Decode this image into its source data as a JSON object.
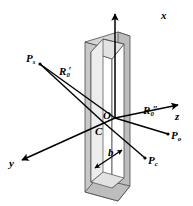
{
  "figure": {
    "kind": "3d-geometry-diagram",
    "background_color": "#ffffff",
    "line_color": "#000000",
    "frame_fill_color": "#c8c8c8",
    "frame_edge_color": "#4a4a4a",
    "frame_inner_fill_color": "#ffffff"
  },
  "axes": [
    {
      "name": "x-axis",
      "label": "x",
      "direction": "up"
    },
    {
      "name": "y-axis",
      "label": "y",
      "direction": "down-left"
    },
    {
      "name": "z-axis",
      "label": "z",
      "direction": "right"
    }
  ],
  "points": [
    {
      "name": "source-point",
      "label": "P",
      "sub": "s"
    },
    {
      "name": "observation-point",
      "label": "P",
      "sub": "o"
    },
    {
      "name": "center-observation-point",
      "label": "P",
      "sub": "c"
    },
    {
      "name": "origin-point",
      "label": "O",
      "sub": ""
    },
    {
      "name": "aperture-center-point",
      "label": "C",
      "sub": ""
    }
  ],
  "distances": [
    {
      "name": "source-distance",
      "label": "R",
      "sub": "0",
      "prime": "′"
    },
    {
      "name": "observation-distance",
      "label": "R",
      "sub": "0",
      "prime": "″"
    }
  ],
  "dimensions": [
    {
      "name": "aperture-width",
      "label": "b"
    }
  ],
  "labels": {
    "x": "x",
    "y": "y",
    "z": "z",
    "P": "P",
    "sub_s": "s",
    "sub_o": "o",
    "sub_c": "c",
    "O": "O",
    "C": "C",
    "R": "R",
    "sub_0": "0",
    "prime_single": "′",
    "prime_double": "″",
    "b": "b"
  }
}
